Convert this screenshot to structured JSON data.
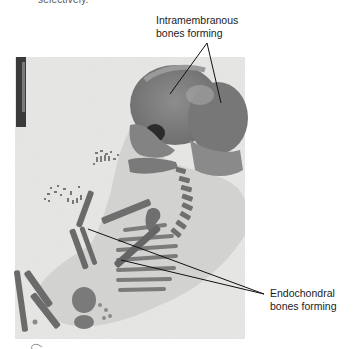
{
  "caption_fragment": "selectively.",
  "figure": {
    "type": "photograph",
    "annotations": [
      {
        "id": "intramembranous",
        "lines": [
          "Intramembranous",
          "bones forming"
        ],
        "pointer_targets": [
          "frontal bone",
          "parietal bone"
        ]
      },
      {
        "id": "endochondral",
        "lines": [
          "Endochondral",
          "bones forming"
        ],
        "pointer_targets": [
          "forelimb long bone",
          "rib"
        ]
      }
    ],
    "page_mark": "C"
  },
  "colors": {
    "background": "#ffffff",
    "photo_bg": "#e6e6e4",
    "bone_dark": "#6e6e6e",
    "bone_mid": "#8c8c8c",
    "tissue": "#b9b9b9",
    "line": "#111111"
  }
}
